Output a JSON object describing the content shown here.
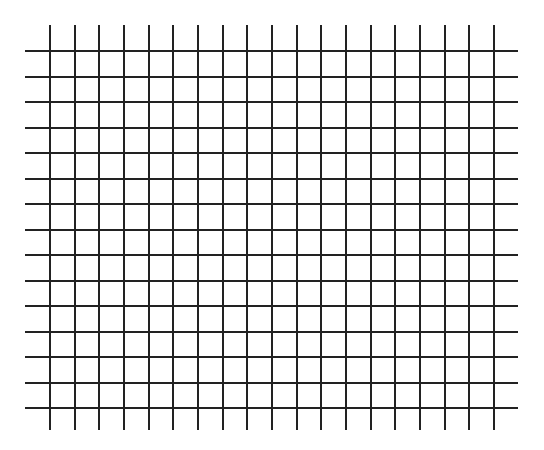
{
  "grid": {
    "line_color": "#222222",
    "background": "#ffffff",
    "horizontal": {
      "count": 15,
      "y_start": 51,
      "y_step": 25.5,
      "x_from": 25,
      "x_to": 518
    },
    "vertical": {
      "count": 19,
      "x_start": 50,
      "x_step": 24.67,
      "y_from": 25,
      "y_to": 430
    }
  }
}
